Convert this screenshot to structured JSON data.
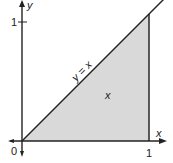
{
  "diagram": {
    "type": "region-plot",
    "axes": {
      "x_label": "x",
      "y_label": "y",
      "origin_label": "0",
      "x_tick_label": "1",
      "y_tick_label": "1"
    },
    "curve": {
      "equation_label": "y = x"
    },
    "region": {
      "label": "x",
      "description": "triangle bounded by y = x, x-axis and x = 1"
    },
    "colors": {
      "axis": "#222222",
      "curve": "#222222",
      "fill": "#d9d9d9",
      "background": "#ffffff"
    }
  }
}
